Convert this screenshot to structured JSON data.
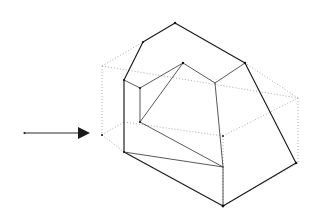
{
  "figure": {
    "canvas": {
      "width": 319,
      "height": 223,
      "background": "#ffffff"
    },
    "colors": {
      "solid_edge": "#1a1a1a",
      "thin_edge": "#3a3a3a",
      "hidden_edge": "#9a9a9a",
      "arrow": "#1a1a1a",
      "background": "#ffffff"
    },
    "arrow": {
      "label": "direction-of-extrusion-arrow",
      "tail_x": 24,
      "tail_y": 133,
      "tip_x": 90,
      "tip_y": 133,
      "head_length": 12,
      "head_half_width": 6
    },
    "bounding_box": {
      "label": "dashed-bounding-box",
      "style": "dashed",
      "front_top_left": [
        102,
        66
      ],
      "front_bottom_left": [
        102,
        135
      ],
      "back_top_right": [
        298,
        98
      ],
      "back_bottom_right": [
        298,
        163
      ]
    },
    "solid": {
      "label": "notched-house-solid",
      "apex": [
        175,
        23
      ],
      "roof_left": [
        143,
        42
      ],
      "roof_right_vertex": [
        245,
        63
      ],
      "front_left_top": [
        124,
        80
      ],
      "front_left_bottom": [
        124,
        152
      ],
      "bottom_front": [
        223,
        206
      ],
      "bottom_right": [
        296,
        163
      ],
      "inner_top": [
        183,
        63
      ],
      "inner_left": [
        140,
        88
      ],
      "inner_left_low": [
        140,
        122
      ],
      "inner_right": [
        215,
        83
      ]
    },
    "geometry_paths": {
      "hidden": [
        "M 102 66 L 298 98",
        "M 102 66 L 102 135",
        "M 102 135 L 124 152",
        "M 102 135 L 124 122",
        "M 102 66 L 143 42",
        "M 298 98 L 298 163",
        "M 298 98 L 245 63",
        "M 298 163 L 296 163",
        "M 298 163 L 223 206",
        "M 124 122 L 223 136",
        "M 223 136 L 298 98",
        "M 223 136 L 223 206",
        "M 124 80 L 140 88"
      ],
      "solid": [
        "M 175 23 L 143 42 L 124 80 L 124 152 L 223 206 L 296 163 L 245 63 L 175 23",
        "M 124 80 L 140 88 L 183 63 L 215 83 L 245 63",
        "M 140 88 L 140 122 L 223 167",
        "M 183 63 L 140 122",
        "M 215 83 L 223 167",
        "M 223 167 L 223 206",
        "M 124 152 L 223 167"
      ]
    }
  }
}
